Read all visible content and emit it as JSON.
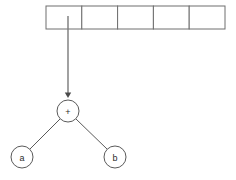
{
  "diagram": {
    "type": "expression-tree-with-array",
    "background_color": "#ffffff",
    "stroke_color": "#5a5a5a",
    "array": {
      "name": "cell-array",
      "cell_count": 5,
      "x": 46,
      "y": 6,
      "width": 179,
      "height": 23,
      "border_color": "#6e6e6e",
      "fill_color": "#ffffff",
      "cells": [
        {
          "index": 0,
          "value": ""
        },
        {
          "index": 1,
          "value": ""
        },
        {
          "index": 2,
          "value": ""
        },
        {
          "index": 3,
          "value": ""
        },
        {
          "index": 4,
          "value": ""
        }
      ]
    },
    "pointer": {
      "name": "array-to-root-pointer",
      "from_cell_index": 0,
      "x": 68,
      "y_start": 16,
      "y_end": 98,
      "color": "#7a7a7a",
      "arrowhead": "down"
    },
    "nodes": [
      {
        "id": "root",
        "label": "+",
        "cx": 68,
        "cy": 111,
        "r": 11
      },
      {
        "id": "left",
        "label": "a",
        "cx": 22,
        "cy": 157,
        "r": 11
      },
      {
        "id": "right",
        "label": "b",
        "cx": 115,
        "cy": 157,
        "r": 11
      }
    ],
    "edges": [
      {
        "from": "root",
        "to": "left",
        "x1": 60,
        "y1": 119,
        "x2": 30,
        "y2": 149
      },
      {
        "from": "root",
        "to": "right",
        "x1": 76,
        "y1": 119,
        "x2": 107,
        "y2": 149
      }
    ]
  }
}
